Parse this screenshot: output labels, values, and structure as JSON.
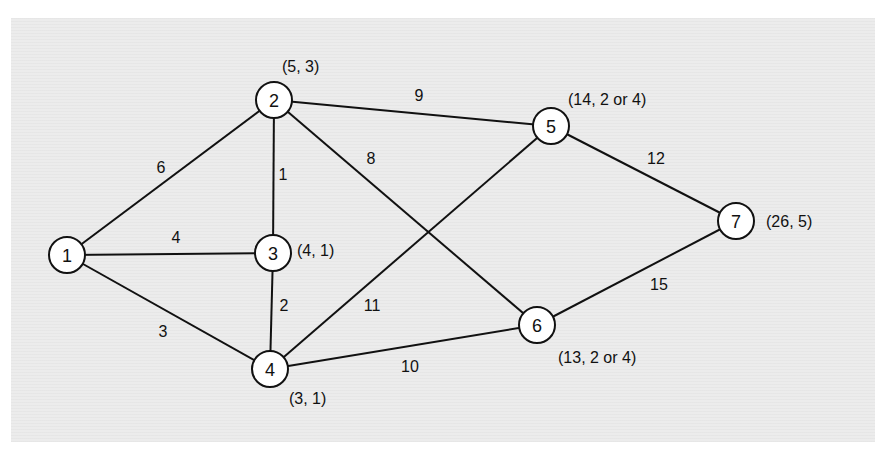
{
  "diagram": {
    "type": "weighted-undirected-graph",
    "nodes": [
      {
        "id": "1",
        "label": "1",
        "x": 67,
        "y": 255,
        "annotation": ""
      },
      {
        "id": "2",
        "label": "2",
        "x": 274,
        "y": 100,
        "annotation": "(5, 3)"
      },
      {
        "id": "3",
        "label": "3",
        "x": 273,
        "y": 253,
        "annotation": "(4, 1)"
      },
      {
        "id": "4",
        "label": "4",
        "x": 270,
        "y": 369,
        "annotation": "(3, 1)"
      },
      {
        "id": "5",
        "label": "5",
        "x": 551,
        "y": 126,
        "annotation": "(14, 2 or 4)"
      },
      {
        "id": "6",
        "label": "6",
        "x": 537,
        "y": 325,
        "annotation": "(13, 2 or 4)"
      },
      {
        "id": "7",
        "label": "7",
        "x": 736,
        "y": 221,
        "annotation": "(26, 5)"
      }
    ],
    "edges": [
      {
        "from": "1",
        "to": "2",
        "weight": "6"
      },
      {
        "from": "1",
        "to": "3",
        "weight": "4"
      },
      {
        "from": "1",
        "to": "4",
        "weight": "3"
      },
      {
        "from": "2",
        "to": "3",
        "weight": "1"
      },
      {
        "from": "2",
        "to": "5",
        "weight": "9"
      },
      {
        "from": "2",
        "to": "6",
        "weight": "8"
      },
      {
        "from": "3",
        "to": "4",
        "weight": "2"
      },
      {
        "from": "4",
        "to": "5",
        "weight": "11"
      },
      {
        "from": "4",
        "to": "6",
        "weight": "10"
      },
      {
        "from": "5",
        "to": "7",
        "weight": "12"
      },
      {
        "from": "6",
        "to": "7",
        "weight": "15"
      }
    ]
  }
}
